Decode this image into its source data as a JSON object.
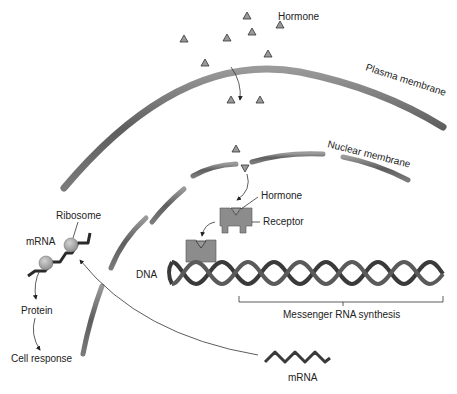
{
  "diagram": {
    "type": "biology-schematic",
    "labels": {
      "hormone_top": "Hormone",
      "plasma_membrane": "Plasma membrane",
      "nuclear_membrane": "Nuclear membrane",
      "hormone_receptor": "Hormone",
      "receptor": "Receptor",
      "dna": "DNA",
      "mrna_synthesis": "Messenger RNA synthesis",
      "mrna_bottom": "mRNA",
      "ribosome": "Ribosome",
      "mrna_left": "mRNA",
      "protein": "Protein",
      "cell_response": "Cell response"
    },
    "colors": {
      "membrane": "#6e6e6e",
      "membrane_highlight": "#9a9a9a",
      "hormone": "#9a9a9a",
      "receptor": "#8c8c8c",
      "dna_strand": "#3a3a3a",
      "ribosome": "#a8a8a8",
      "text": "#222222"
    },
    "hormone_count_extracellular": 10,
    "dna_helix_turns": 11,
    "flow": [
      "Hormone",
      "Plasma membrane",
      "Nuclear membrane",
      "Receptor",
      "DNA",
      "Messenger RNA synthesis",
      "mRNA",
      "Ribosome",
      "Protein",
      "Cell response"
    ]
  }
}
